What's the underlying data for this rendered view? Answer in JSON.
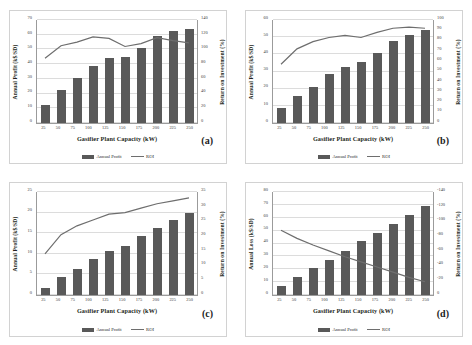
{
  "figure": {
    "panels": [
      {
        "tag": "(a)",
        "xtitle": "Gasifier Plant Capacity (kW)",
        "ytitle": "Annual Profit (k$/SD)",
        "y2title": "Return on Investment (%)",
        "legend": [
          {
            "name": "Annual Profit",
            "type": "bar"
          },
          {
            "name": "ROI",
            "type": "line"
          }
        ],
        "yticks": [
          "0",
          "10",
          "20",
          "30",
          "40",
          "50",
          "60",
          "70"
        ],
        "y2ticks": [
          "0",
          "20",
          "40",
          "60",
          "80",
          "100",
          "120",
          "140"
        ],
        "xticks": [
          "25",
          "50",
          "75",
          "100",
          "125",
          "150",
          "175",
          "200",
          "225",
          "250"
        ]
      },
      {
        "tag": "(b)",
        "xtitle": "Gasifier Plant Capacity (kW)",
        "ytitle": "Annual Profit (k$/SD)",
        "y2title": "Return on Investment (%)",
        "legend": [
          {
            "name": "Annual Profit",
            "type": "bar"
          },
          {
            "name": "ROI",
            "type": "line"
          }
        ],
        "yticks": [
          "0",
          "10",
          "20",
          "30",
          "40",
          "50",
          "60"
        ],
        "y2ticks": [
          "0",
          "10",
          "20",
          "30",
          "40",
          "50",
          "60",
          "70",
          "80",
          "90",
          "100"
        ],
        "xticks": [
          "25",
          "50",
          "75",
          "100",
          "125",
          "150",
          "175",
          "200",
          "225",
          "250"
        ]
      },
      {
        "tag": "(c)",
        "xtitle": "Gasifier Plant Capacity (kW)",
        "ytitle": "Annual Profit (k$/SD)",
        "y2title": "Return on Investment (%)",
        "legend": [
          {
            "name": "Annual Profit",
            "type": "bar"
          },
          {
            "name": "ROI",
            "type": "line"
          }
        ],
        "yticks": [
          "0",
          "5",
          "10",
          "15",
          "20",
          "25"
        ],
        "y2ticks": [
          "0",
          "5",
          "10",
          "15",
          "20",
          "25",
          "30",
          "35"
        ],
        "xticks": [
          "25",
          "50",
          "75",
          "100",
          "125",
          "150",
          "175",
          "200",
          "225",
          "250"
        ]
      },
      {
        "tag": "(d)",
        "xtitle": "Gasifier Plant Capacity (kW)",
        "ytitle": "Annual Loss (k$/SD)",
        "y2title": "Return on Investment (%)",
        "legend": [
          {
            "name": "Annual Profit",
            "type": "bar"
          },
          {
            "name": "ROI",
            "type": "line"
          }
        ],
        "yticks": [
          "0",
          "10",
          "20",
          "30",
          "40",
          "50",
          "60",
          "70",
          "80"
        ],
        "y2ticks": [
          "0",
          "-20",
          "-40",
          "-60",
          "-80",
          "-100",
          "-120",
          "-140"
        ],
        "xticks": [
          "25",
          "50",
          "75",
          "100",
          "125",
          "150",
          "175",
          "200",
          "225",
          "250"
        ]
      }
    ]
  },
  "colors": {
    "bar": "#595959",
    "line": "#6e6e6e",
    "grid": "#dcdcdc",
    "axis": "#9b9b9b",
    "panel_border": "#d2d2d2"
  },
  "chart_data": [
    {
      "type": "bar",
      "panel": "(a)",
      "title": "",
      "xlabel": "Gasifier Plant Capacity (kW)",
      "ylabel": "Annual Profit (k$/SD)",
      "y2label": "Return on Investment (%)",
      "categories": [
        25,
        50,
        75,
        100,
        125,
        150,
        175,
        200,
        225,
        250
      ],
      "ylim": [
        0,
        70
      ],
      "y2lim": [
        0,
        140
      ],
      "grid": true,
      "legend_position": "bottom",
      "series": [
        {
          "name": "Annual Profit",
          "type": "bar",
          "axis": "left",
          "values": [
            12.0,
            22.5,
            30.5,
            38.5,
            44.0,
            44.8,
            51.0,
            59.0,
            62.5,
            64.0
          ]
        },
        {
          "name": "ROI",
          "type": "line",
          "axis": "right",
          "values": [
            88,
            105,
            110,
            117,
            115,
            104,
            108,
            116,
            112,
            109
          ]
        }
      ]
    },
    {
      "type": "bar",
      "panel": "(b)",
      "title": "",
      "xlabel": "Gasifier Plant Capacity (kW)",
      "ylabel": "Annual Profit (k$/SD)",
      "y2label": "Return on Investment (%)",
      "categories": [
        25,
        50,
        75,
        100,
        125,
        150,
        175,
        200,
        225,
        250
      ],
      "ylim": [
        0,
        60
      ],
      "y2lim": [
        0,
        100
      ],
      "grid": true,
      "legend_position": "bottom",
      "series": [
        {
          "name": "Annual Profit",
          "type": "bar",
          "axis": "left",
          "values": [
            8.5,
            15.5,
            21.0,
            28.5,
            32.5,
            35.5,
            41.0,
            48.0,
            51.5,
            54.0
          ]
        },
        {
          "name": "ROI",
          "type": "line",
          "axis": "right",
          "values": [
            57,
            72,
            79,
            83,
            85,
            83,
            88,
            92,
            93,
            92
          ]
        }
      ]
    },
    {
      "type": "bar",
      "panel": "(c)",
      "title": "",
      "xlabel": "Gasifier Plant Capacity (kW)",
      "ylabel": "Annual Profit (k$/SD)",
      "y2label": "Return on Investment (%)",
      "categories": [
        25,
        50,
        75,
        100,
        125,
        150,
        175,
        200,
        225,
        250
      ],
      "ylim": [
        0,
        25
      ],
      "y2lim": [
        0,
        35
      ],
      "grid": true,
      "legend_position": "bottom",
      "series": [
        {
          "name": "Annual Profit",
          "type": "bar",
          "axis": "left",
          "values": [
            1.7,
            4.3,
            6.2,
            8.8,
            10.6,
            11.8,
            14.3,
            16.3,
            18.3,
            19.8
          ]
        },
        {
          "name": "ROI",
          "type": "line",
          "axis": "right",
          "values": [
            14.0,
            20.5,
            23.5,
            25.5,
            27.5,
            28.0,
            29.5,
            31.0,
            32.0,
            33.0
          ]
        }
      ]
    },
    {
      "type": "bar",
      "panel": "(d)",
      "title": "",
      "xlabel": "Gasifier Plant Capacity (kW)",
      "ylabel": "Annual Loss (k$/SD)",
      "y2label": "Return on Investment (%)",
      "categories": [
        25,
        50,
        75,
        100,
        125,
        150,
        175,
        200,
        225,
        250
      ],
      "ylim": [
        0,
        80
      ],
      "y2lim": [
        -140,
        0
      ],
      "grid": true,
      "legend_position": "bottom",
      "series": [
        {
          "name": "Annual Profit",
          "type": "bar",
          "axis": "left",
          "values": [
            7.0,
            14.0,
            21.0,
            27.5,
            34.5,
            42.0,
            48.5,
            55.5,
            62.0,
            69.5
          ]
        },
        {
          "name": "ROI",
          "type": "line",
          "axis": "right",
          "values": [
            -52,
            -63,
            -72,
            -80,
            -88,
            -95,
            -102,
            -109,
            -116,
            -122
          ]
        }
      ]
    }
  ]
}
